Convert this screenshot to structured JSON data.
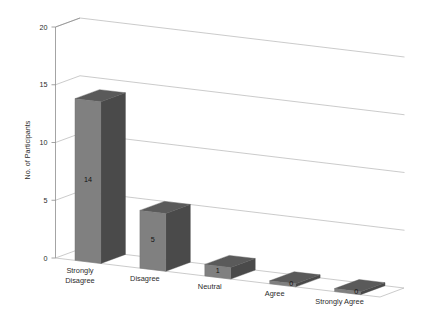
{
  "chart_data": {
    "type": "bar",
    "style": "3d-column",
    "title": "",
    "subtitle": "",
    "xlabel": "",
    "ylabel": "No. of Participants",
    "categories": [
      "Strongly Disagree",
      "Disagree",
      "Neutral",
      "Agree",
      "Strongly Agree"
    ],
    "values": [
      14,
      5,
      1,
      0,
      0
    ],
    "data_labels": [
      "14",
      "5",
      "1",
      "0",
      "0"
    ],
    "ylim": [
      0,
      20
    ],
    "ytick_labels": [
      "0",
      "5",
      "10",
      "15",
      "20"
    ],
    "ytick_values": [
      0,
      5,
      10,
      15,
      20
    ],
    "grid": true,
    "grid_axis": "y",
    "legend": false,
    "legend_position": "none",
    "series": [
      {
        "name": "No. of Participants",
        "values": [
          14,
          5,
          1,
          0,
          0
        ]
      }
    ]
  },
  "axes": {
    "y_title": "No. of Participants",
    "y_ticks": [
      {
        "label": "20",
        "value": 20
      },
      {
        "label": "15",
        "value": 15
      },
      {
        "label": "10",
        "value": 10
      },
      {
        "label": "5",
        "value": 5
      },
      {
        "label": "0",
        "value": 0
      }
    ],
    "x_categories": [
      {
        "label_line1": "Strongly",
        "label_line2": "Disagree",
        "full": "Strongly Disagree"
      },
      {
        "label_line1": "Disagree",
        "label_line2": "",
        "full": "Disagree"
      },
      {
        "label_line1": "Neutral",
        "label_line2": "",
        "full": "Neutral"
      },
      {
        "label_line1": "Agree",
        "label_line2": "",
        "full": "Agree"
      },
      {
        "label_line1": "Strongly Agree",
        "label_line2": "",
        "full": "Strongly Agree"
      }
    ]
  },
  "bars": [
    {
      "category": "Strongly Disagree",
      "value": 14,
      "label": "14"
    },
    {
      "category": "Disagree",
      "value": 5,
      "label": "5"
    },
    {
      "category": "Neutral",
      "value": 1,
      "label": "1"
    },
    {
      "category": "Agree",
      "value": 0,
      "label": "0"
    },
    {
      "category": "Strongly Agree",
      "value": 0,
      "label": "0"
    }
  ],
  "colors": {
    "background": "#ffffff",
    "bar_front": "#808080",
    "bar_side": "#4a4a4a",
    "bar_top": "#5a5a5a",
    "gridline": "#b4b4b4",
    "axis": "#8d8d8d",
    "text": "#2b2b2b"
  }
}
